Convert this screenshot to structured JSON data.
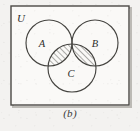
{
  "figure": {
    "caption": "(b)",
    "universe_label": "U",
    "set_labels": {
      "a": "A",
      "b": "B",
      "c": "C"
    },
    "shaded_description": "C ∩ (A ∪ B)",
    "colors": {
      "background": "#f3f2f0",
      "stroke": "#454440",
      "rect_stroke": "#4a4945",
      "hatch": "#4e4d48",
      "text": "#2e2e2c",
      "shadow": "#b9b7b2"
    },
    "geometry": {
      "rect": {
        "x": 11,
        "y": 6,
        "width": 118,
        "height": 99
      },
      "circle_a": {
        "cx": 49,
        "cy": 43,
        "r": 23
      },
      "circle_b": {
        "cx": 95,
        "cy": 43,
        "r": 23
      },
      "circle_c": {
        "cx": 72,
        "cy": 68,
        "r": 24
      }
    },
    "label_positions": {
      "universe": {
        "x": 21,
        "y": 22
      },
      "a": {
        "x": 42,
        "y": 47
      },
      "b": {
        "x": 95,
        "y": 47
      },
      "c": {
        "x": 71,
        "y": 77
      }
    }
  }
}
